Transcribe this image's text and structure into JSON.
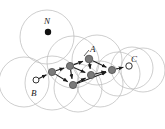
{
  "figure": {
    "background_color": "#ffffff",
    "circle_stroke_color": "#b9b9b9",
    "node_fill_color": "#7a7a7a",
    "node_stroke_color": "#4d4d4d",
    "hollow_node_fill": "#ffffff",
    "hollow_node_stroke": "#333333",
    "edge_color": "#1c1c1c",
    "dot_color": "#111111",
    "label_color": "#1a1a1a"
  },
  "labels": [
    {
      "id": "N",
      "text": "N",
      "x": 44,
      "y": 17
    },
    {
      "id": "A",
      "text": "A",
      "x": 90,
      "y": 45
    },
    {
      "id": "B",
      "text": "B",
      "x": 31,
      "y": 89
    },
    {
      "id": "C",
      "text": "C",
      "x": 131,
      "y": 55
    }
  ],
  "coverage_circles": [
    {
      "cx": 47,
      "cy": 37,
      "r": 27
    },
    {
      "cx": 24,
      "cy": 82,
      "r": 25
    },
    {
      "cx": 52,
      "cy": 83,
      "r": 27
    },
    {
      "cx": 73,
      "cy": 62,
      "r": 26
    },
    {
      "cx": 78,
      "cy": 88,
      "r": 24
    },
    {
      "cx": 97,
      "cy": 60,
      "r": 25
    },
    {
      "cx": 100,
      "cy": 84,
      "r": 23
    },
    {
      "cx": 118,
      "cy": 74,
      "r": 22
    },
    {
      "cx": 132,
      "cy": 68,
      "r": 21
    },
    {
      "cx": 143,
      "cy": 70,
      "r": 22
    }
  ],
  "nodes": [
    {
      "id": "dot_N",
      "type": "solid-dot",
      "x": 48,
      "y": 32,
      "r": 3.2
    },
    {
      "id": "B",
      "type": "hollow",
      "x": 36,
      "y": 80,
      "r": 3.0
    },
    {
      "id": "n1",
      "type": "filled",
      "x": 52,
      "y": 72,
      "r": 3.6
    },
    {
      "id": "n2",
      "type": "filled",
      "x": 70,
      "y": 66,
      "r": 3.6
    },
    {
      "id": "n3",
      "type": "filled",
      "x": 89,
      "y": 59,
      "r": 3.8
    },
    {
      "id": "n4",
      "type": "filled",
      "x": 73,
      "y": 85,
      "r": 3.6
    },
    {
      "id": "n5",
      "type": "filled",
      "x": 91,
      "y": 75,
      "r": 3.6
    },
    {
      "id": "n6",
      "type": "filled",
      "x": 112,
      "y": 70,
      "r": 3.6
    },
    {
      "id": "C",
      "type": "hollow",
      "x": 129,
      "y": 66,
      "r": 3.2
    }
  ],
  "edges": [
    {
      "from": "B",
      "to": "n1",
      "arrow": true
    },
    {
      "from": "n1",
      "to": "n2",
      "arrow": true
    },
    {
      "from": "n2",
      "to": "n3",
      "arrow": true
    },
    {
      "from": "n1",
      "to": "n4",
      "arrow": true
    },
    {
      "from": "n2",
      "to": "n4",
      "arrow": true
    },
    {
      "from": "n2",
      "to": "n5",
      "arrow": true
    },
    {
      "from": "n3",
      "to": "n5",
      "arrow": true
    },
    {
      "from": "n4",
      "to": "n5",
      "arrow": true
    },
    {
      "from": "n5",
      "to": "n6",
      "arrow": true
    },
    {
      "from": "n3",
      "to": "n6",
      "arrow": true
    },
    {
      "from": "n4",
      "to": "n6",
      "arrow": true
    },
    {
      "from": "n6",
      "to": "C",
      "arrow": true
    }
  ],
  "leader_lines": [
    {
      "id": "A-leader",
      "x1": 89,
      "y1": 50,
      "x2": 84,
      "y2": 56
    }
  ]
}
